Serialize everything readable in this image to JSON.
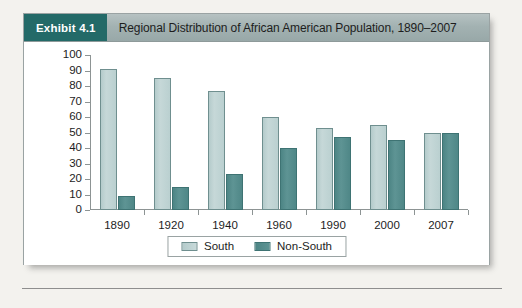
{
  "exhibit": {
    "badge_label": "Exhibit 4.1",
    "title": "Regional Distribution of African American Population, 1890–2007",
    "badge_color": "#236a68",
    "header_color": "#a3b2b2"
  },
  "legend": {
    "position": "bottom-center",
    "items": [
      {
        "label": "South",
        "color": "#bcd3d3"
      },
      {
        "label": "Non-South",
        "color": "#528b8b"
      }
    ]
  },
  "chart_data": {
    "type": "bar",
    "title": "Regional Distribution of African American Population, 1890–2007",
    "xlabel": "",
    "ylabel": "",
    "categories": [
      "1890",
      "1920",
      "1940",
      "1960",
      "1990",
      "2000",
      "2007"
    ],
    "series": [
      {
        "name": "South",
        "color": "#bcd3d3",
        "values": [
          91,
          85,
          77,
          60,
          53,
          55,
          50
        ]
      },
      {
        "name": "Non-South",
        "color": "#528b8b",
        "values": [
          9,
          15,
          23,
          40,
          47,
          45,
          50
        ]
      }
    ],
    "ylim": [
      0,
      100
    ],
    "yticks": [
      0,
      10,
      20,
      30,
      40,
      50,
      60,
      70,
      80,
      90,
      100
    ],
    "ytick_labels": [
      "0",
      "10",
      "20",
      "30",
      "40",
      "50",
      "60",
      "70",
      "80",
      "90",
      "100"
    ],
    "grid": false,
    "legend": [
      "South",
      "Non-South"
    ]
  }
}
